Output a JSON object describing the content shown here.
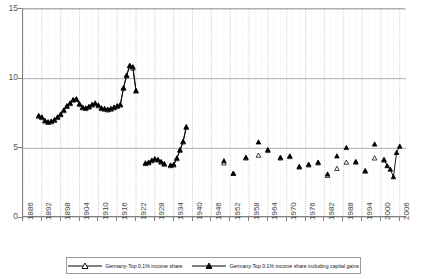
{
  "chart_data": {
    "type": "line",
    "title": "",
    "xlabel": "",
    "ylabel": "",
    "xlim": [
      1886,
      2008
    ],
    "ylim": [
      0,
      15
    ],
    "grid": true,
    "legend_position": "bottom",
    "y_ticks": [
      "15",
      "10",
      "5",
      "0"
    ],
    "y_tick_values": [
      15,
      10,
      5,
      0
    ],
    "x_ticks": [
      "1886",
      "1892",
      "1898",
      "1904",
      "1910",
      "1916",
      "1922",
      "1928",
      "1934",
      "1940",
      "1946",
      "1952",
      "1958",
      "1964",
      "1970",
      "1976",
      "1982",
      "1988",
      "1994",
      "2000",
      "2006"
    ],
    "x_tick_values": [
      1886,
      1892,
      1898,
      1904,
      1910,
      1916,
      1922,
      1928,
      1934,
      1940,
      1946,
      1952,
      1958,
      1964,
      1970,
      1976,
      1982,
      1988,
      1994,
      2000,
      2006
    ],
    "series": [
      {
        "name": "Germany-Top 0.1% income share",
        "marker": "open-triangle",
        "color": "#000000",
        "points": [
          [
            1891,
            7.3
          ],
          [
            1892,
            7.2
          ],
          [
            1893,
            6.95
          ],
          [
            1894,
            6.85
          ],
          [
            1895,
            6.9
          ],
          [
            1896,
            7.0
          ],
          [
            1897,
            7.2
          ],
          [
            1898,
            7.4
          ],
          [
            1899,
            7.7
          ],
          [
            1900,
            8.0
          ],
          [
            1901,
            8.2
          ],
          [
            1902,
            8.45
          ],
          [
            1903,
            8.5
          ],
          [
            1904,
            8.15
          ],
          [
            1905,
            7.9
          ],
          [
            1906,
            7.85
          ],
          [
            1907,
            7.95
          ],
          [
            1908,
            8.1
          ],
          [
            1909,
            8.2
          ],
          [
            1910,
            8.05
          ],
          [
            1911,
            7.85
          ],
          [
            1912,
            7.8
          ],
          [
            1913,
            7.75
          ],
          [
            1914,
            7.8
          ],
          [
            1915,
            7.9
          ],
          [
            1916,
            8.0
          ],
          [
            1917,
            8.1
          ],
          [
            1918,
            9.3
          ],
          [
            1919,
            10.2
          ],
          [
            1920,
            10.9
          ],
          [
            1921,
            10.75
          ],
          [
            1922,
            9.1
          ],
          [
            1925,
            3.9
          ],
          [
            1926,
            3.95
          ],
          [
            1927,
            4.1
          ],
          [
            1928,
            4.2
          ],
          [
            1929,
            4.15
          ],
          [
            1930,
            4.0
          ],
          [
            1931,
            3.85
          ],
          [
            1933,
            3.75
          ],
          [
            1934,
            3.8
          ],
          [
            1935,
            4.25
          ],
          [
            1936,
            4.85
          ],
          [
            1937,
            5.45
          ],
          [
            1938,
            6.5
          ],
          [
            1950,
            3.95
          ],
          [
            1953,
            3.2
          ],
          [
            1957,
            4.3
          ],
          [
            1961,
            4.5
          ],
          [
            1964,
            4.85
          ],
          [
            1968,
            4.3
          ],
          [
            1971,
            4.4
          ],
          [
            1974,
            3.65
          ],
          [
            1977,
            3.8
          ],
          [
            1980,
            3.95
          ],
          [
            1983,
            3.05
          ],
          [
            1986,
            3.55
          ],
          [
            1989,
            4.0
          ],
          [
            1992,
            4.0
          ],
          [
            1995,
            3.35
          ],
          [
            1998,
            4.3
          ],
          [
            2001,
            4.15
          ]
        ]
      },
      {
        "name": "Germany-Top 0.1% income share including capital gains",
        "marker": "filled-triangle",
        "color": "#000000",
        "points": [
          [
            1891,
            7.35
          ],
          [
            1892,
            7.25
          ],
          [
            1893,
            7.0
          ],
          [
            1894,
            6.9
          ],
          [
            1895,
            6.95
          ],
          [
            1896,
            7.05
          ],
          [
            1897,
            7.25
          ],
          [
            1898,
            7.45
          ],
          [
            1899,
            7.75
          ],
          [
            1900,
            8.05
          ],
          [
            1901,
            8.25
          ],
          [
            1902,
            8.5
          ],
          [
            1903,
            8.55
          ],
          [
            1904,
            8.2
          ],
          [
            1905,
            7.95
          ],
          [
            1906,
            7.9
          ],
          [
            1907,
            8.0
          ],
          [
            1908,
            8.15
          ],
          [
            1909,
            8.25
          ],
          [
            1910,
            8.1
          ],
          [
            1911,
            7.9
          ],
          [
            1912,
            7.85
          ],
          [
            1913,
            7.8
          ],
          [
            1914,
            7.85
          ],
          [
            1915,
            7.95
          ],
          [
            1916,
            8.05
          ],
          [
            1917,
            8.15
          ],
          [
            1918,
            9.35
          ],
          [
            1919,
            10.25
          ],
          [
            1920,
            10.95
          ],
          [
            1921,
            10.85
          ],
          [
            1922,
            9.15
          ],
          [
            1925,
            3.95
          ],
          [
            1926,
            4.0
          ],
          [
            1927,
            4.15
          ],
          [
            1928,
            4.25
          ],
          [
            1929,
            4.2
          ],
          [
            1930,
            4.05
          ],
          [
            1931,
            3.9
          ],
          [
            1933,
            3.8
          ],
          [
            1934,
            3.85
          ],
          [
            1935,
            4.3
          ],
          [
            1936,
            4.9
          ],
          [
            1937,
            5.5
          ],
          [
            1938,
            6.55
          ],
          [
            1950,
            4.1
          ],
          [
            1953,
            3.2
          ],
          [
            1957,
            4.35
          ],
          [
            1961,
            5.45
          ],
          [
            1964,
            4.9
          ],
          [
            1968,
            4.35
          ],
          [
            1971,
            4.45
          ],
          [
            1974,
            3.7
          ],
          [
            1977,
            3.85
          ],
          [
            1980,
            4.0
          ],
          [
            1983,
            3.15
          ],
          [
            1986,
            4.45
          ],
          [
            1989,
            5.05
          ],
          [
            1992,
            4.05
          ],
          [
            1995,
            3.4
          ],
          [
            1998,
            5.3
          ],
          [
            2001,
            4.2
          ],
          [
            2002,
            3.75
          ],
          [
            2003,
            3.5
          ],
          [
            2004,
            2.95
          ],
          [
            2005,
            4.7
          ],
          [
            2006,
            5.15
          ]
        ]
      }
    ],
    "connected_segments": {
      "open": [
        [
          1891,
          1922
        ],
        [
          1925,
          1931
        ],
        [
          1933,
          1938
        ]
      ],
      "filled": [
        [
          1891,
          1922
        ],
        [
          1925,
          1931
        ],
        [
          1933,
          1938
        ],
        [
          2001,
          2006
        ]
      ]
    }
  },
  "legend": {
    "items": [
      {
        "label": "Germany-Top 0.1% income share",
        "marker": "open-triangle"
      },
      {
        "label": "Germany-Top 0.1% income share including capital gains",
        "marker": "filled-triangle"
      }
    ]
  }
}
